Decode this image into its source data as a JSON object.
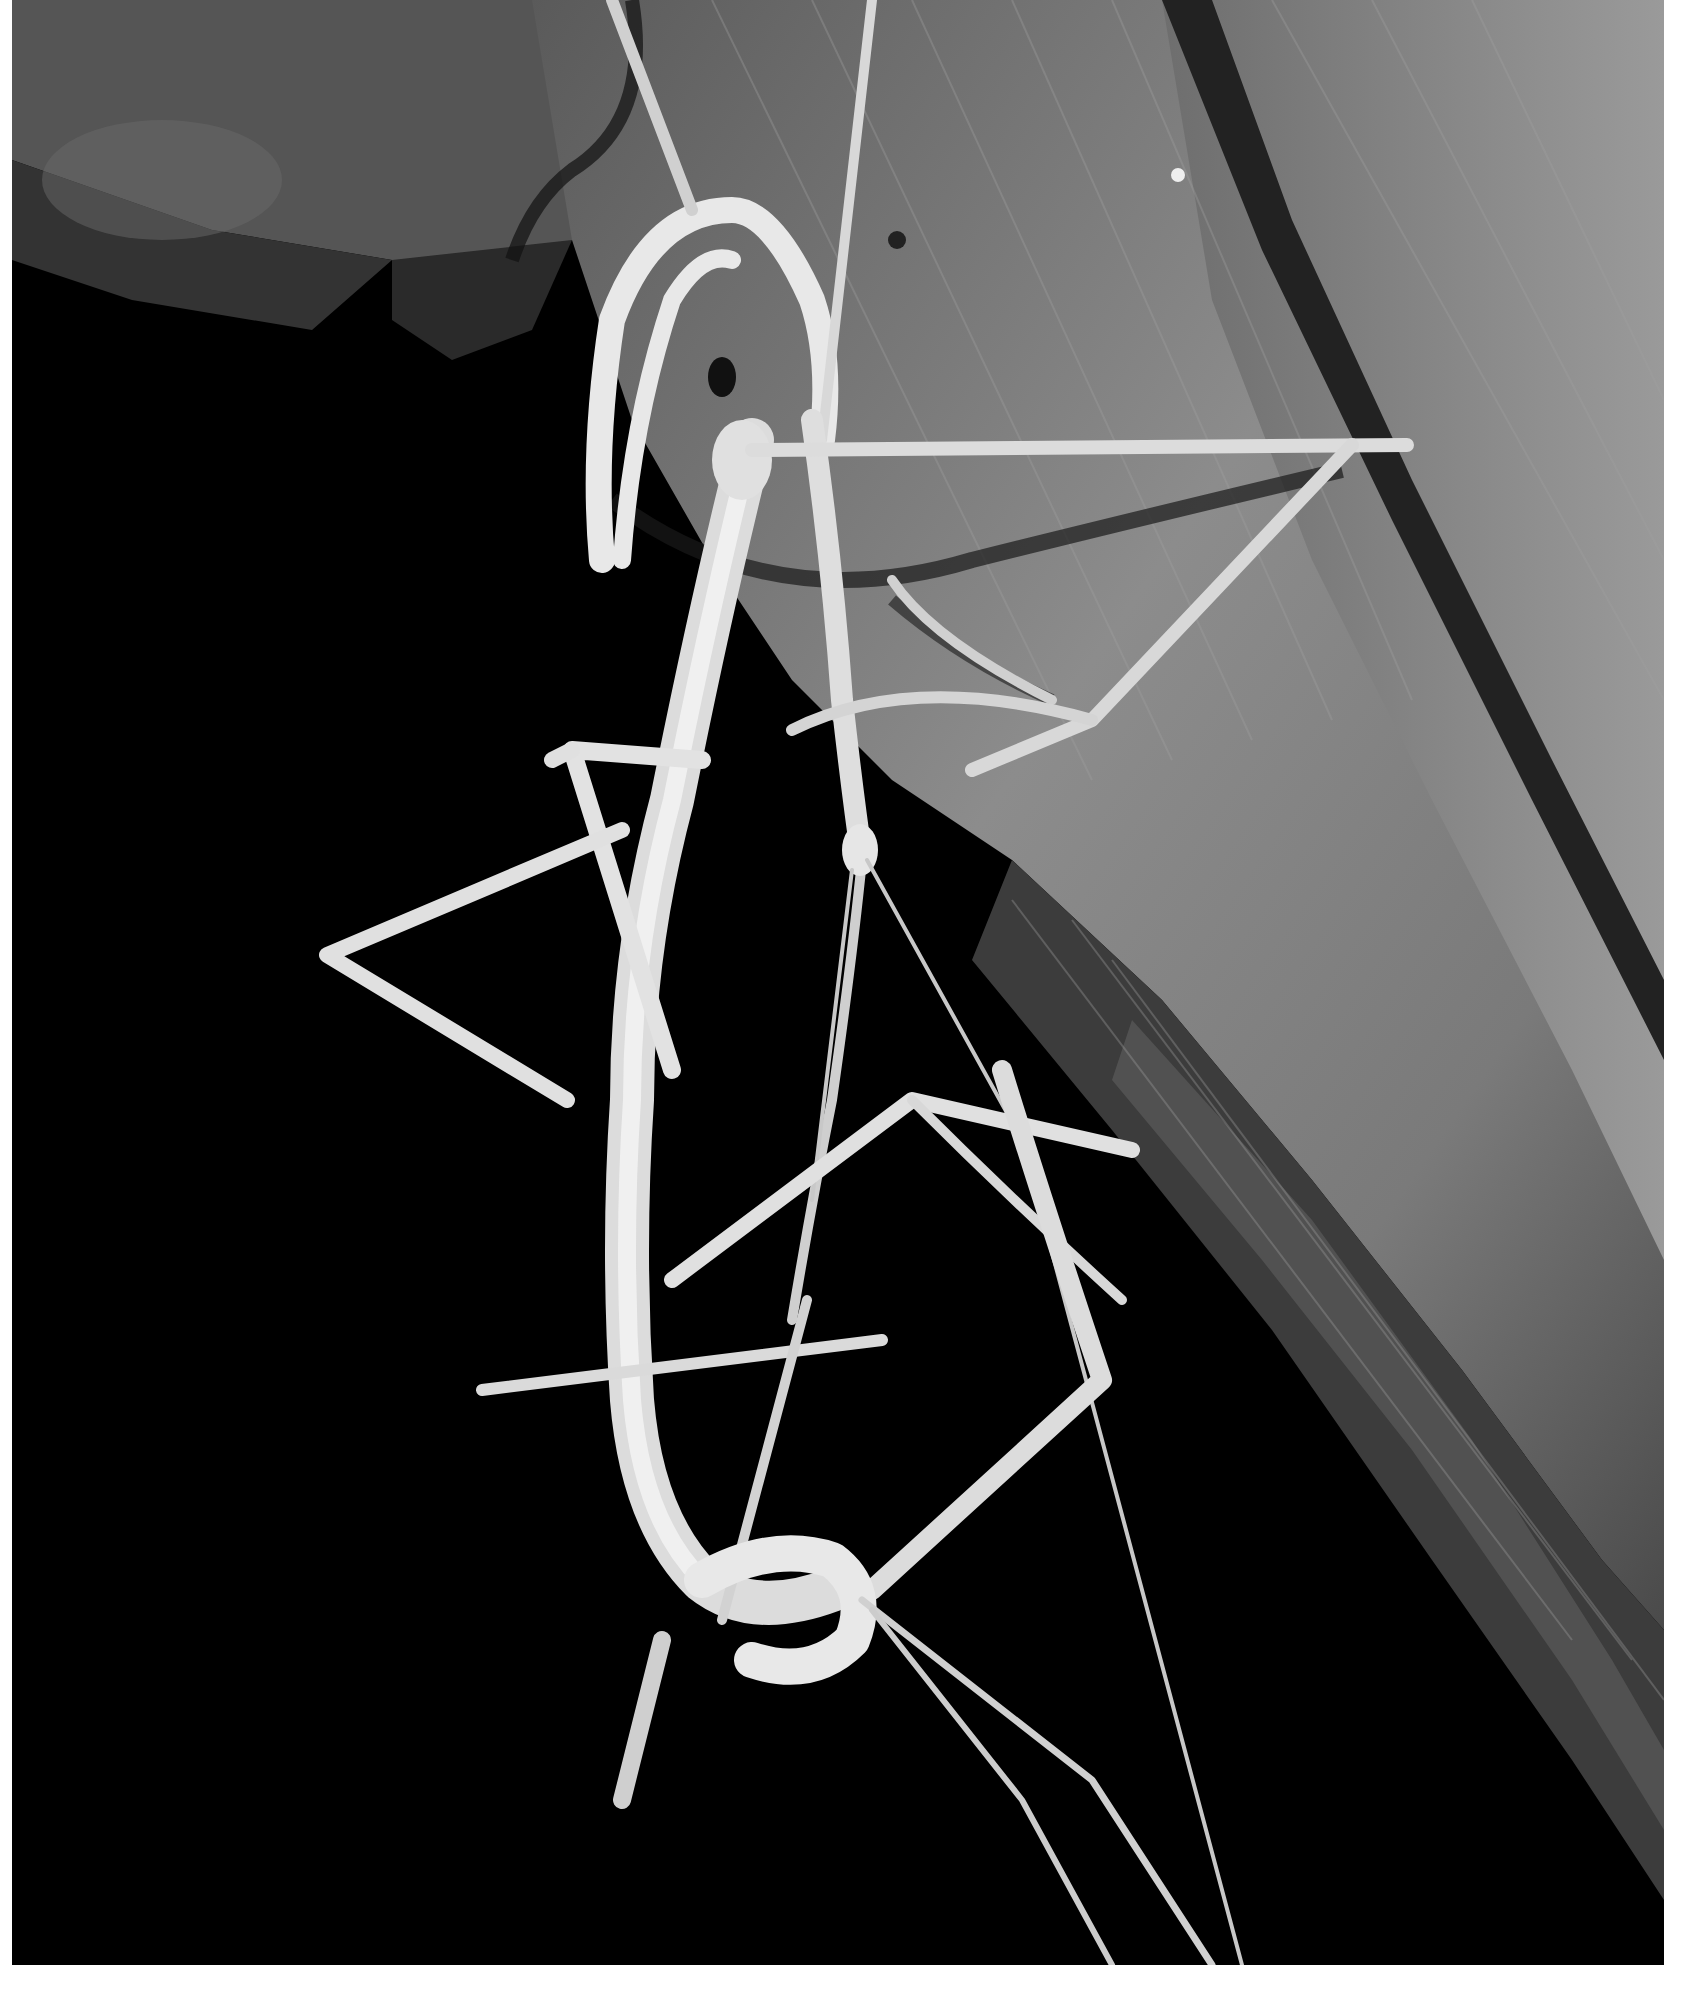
{
  "photo": {
    "description": "Black-and-white night photograph of a mating pair of stick insects (phasmids) hanging beneath a folded palm leaf",
    "subjects": [
      "large stick insect (female)",
      "smaller stick insect (male) on top",
      "palm leaf with parallel veins"
    ],
    "colors": {
      "page_background": "#ffffff",
      "night_background": "#000000",
      "leaf_light": "#8a8a8a",
      "leaf_mid": "#6a6a6a",
      "leaf_dark": "#3a3a3a",
      "insect_body": "#e6e6e6",
      "insect_highlight": "#f7f7f7"
    }
  }
}
